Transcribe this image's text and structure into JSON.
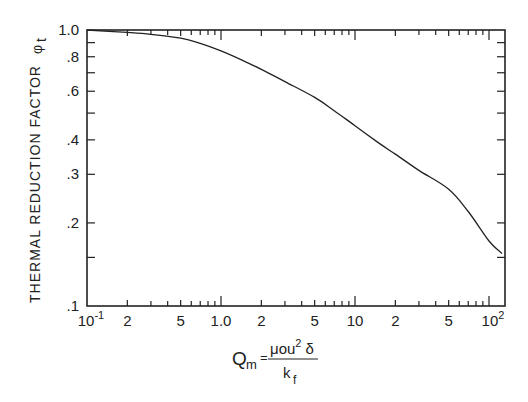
{
  "chart_data": {
    "type": "line",
    "title": "",
    "xlabel": "Q_m = μ₀u²δ / k_f",
    "xlabel_parts": {
      "lhs": "Q",
      "lhs_sub": "m",
      "eq": "=",
      "numerator": "μou",
      "numerator_sup": "2",
      "numerator_tail": " δ",
      "denominator": "k",
      "denominator_sub": "f"
    },
    "ylabel": "THERMAL REDUCTION FACTOR φt",
    "ylabel_parts": {
      "text": "THERMAL REDUCTION FACTOR",
      "symbol": "φ",
      "symbol_sub": "t"
    },
    "xscale": "log",
    "yscale": "log",
    "xlim": [
      0.1,
      125
    ],
    "ylim": [
      0.1,
      1.0
    ],
    "grid": false,
    "legend": null,
    "x_tick_labels": [
      {
        "value": 0.1,
        "label": "10",
        "sup": "-1"
      },
      {
        "value": 0.2,
        "label": "2"
      },
      {
        "value": 0.5,
        "label": "5"
      },
      {
        "value": 1.0,
        "label": "1.0"
      },
      {
        "value": 2,
        "label": "2"
      },
      {
        "value": 5,
        "label": "5"
      },
      {
        "value": 10,
        "label": "10"
      },
      {
        "value": 20,
        "label": "2"
      },
      {
        "value": 50,
        "label": "5"
      },
      {
        "value": 100,
        "label": "10",
        "sup": "2"
      }
    ],
    "y_tick_labels": [
      {
        "value": 1.0,
        "label": "1.0"
      },
      {
        "value": 0.8,
        "label": ".8"
      },
      {
        "value": 0.6,
        "label": ".6"
      },
      {
        "value": 0.4,
        "label": ".4"
      },
      {
        "value": 0.3,
        "label": ".3"
      },
      {
        "value": 0.2,
        "label": ".2"
      },
      {
        "value": 0.1,
        "label": ".1"
      }
    ],
    "y_minor_ticks": [
      0.9,
      0.7,
      0.5,
      0.15
    ],
    "series": [
      {
        "name": "φt",
        "x": [
          0.1,
          0.2,
          0.3,
          0.5,
          0.7,
          1.0,
          1.5,
          2,
          3,
          5,
          7,
          10,
          15,
          20,
          30,
          50,
          70,
          100,
          125
        ],
        "y": [
          1.0,
          0.98,
          0.965,
          0.935,
          0.895,
          0.84,
          0.77,
          0.72,
          0.65,
          0.57,
          0.51,
          0.45,
          0.39,
          0.355,
          0.31,
          0.265,
          0.22,
          0.172,
          0.155
        ]
      }
    ]
  }
}
